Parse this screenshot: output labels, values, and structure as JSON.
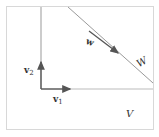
{
  "diagram": {
    "space_label": "V",
    "subspace_label": "W",
    "vectors": {
      "v1": {
        "name": "v",
        "sub": "1"
      },
      "v2": {
        "name": "v",
        "sub": "2"
      },
      "w": {
        "name": "w"
      }
    },
    "colors": {
      "frame": "#d8d8d8",
      "axis": "#888888",
      "line_W": "#9a9a9a",
      "vector": "#555555"
    }
  }
}
